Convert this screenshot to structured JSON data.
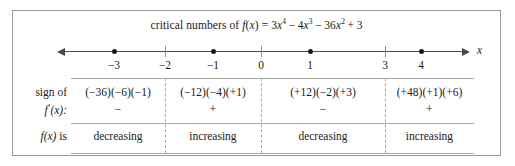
{
  "figure": {
    "title": {
      "prefix": "critical numbers of",
      "function_name": "f",
      "variable": "x",
      "equals": "=",
      "expression_plain": "3x^4 - 4x^3 - 36x^2 + 3",
      "terms": [
        {
          "coef": "3",
          "var": "x",
          "exp": "4"
        },
        {
          "op": "−",
          "coef": "4",
          "var": "x",
          "exp": "3"
        },
        {
          "op": "−",
          "coef": "36",
          "var": "x",
          "exp": "2"
        },
        {
          "op": "+",
          "coef": "3",
          "var": "",
          "exp": ""
        }
      ]
    },
    "axis": {
      "variable_label": "x",
      "left_arrow": true,
      "right_arrow": true,
      "ticks": [
        {
          "label": "−3",
          "value": -3,
          "critical": true
        },
        {
          "label": "−2",
          "value": -2,
          "critical": false
        },
        {
          "label": "−1",
          "value": -1,
          "critical": true
        },
        {
          "label": "0",
          "value": 0,
          "critical": false
        },
        {
          "label": "1",
          "value": 1,
          "critical": true
        },
        {
          "label": "3",
          "value": 3,
          "critical": false
        },
        {
          "label": "4",
          "value": 4,
          "critical": false
        }
      ],
      "critical_numbers": [
        -3,
        -1,
        1,
        4
      ]
    },
    "table": {
      "row_labels": {
        "sign_line1": "sign of",
        "sign_line2_fn": "f",
        "sign_line2_prime": "′",
        "sign_line2_arg": "(x):",
        "behavior_fn": "f",
        "behavior_arg": "(x)",
        "behavior_verb": "is"
      },
      "columns": [
        {
          "interval": "(−∞, −3)",
          "factors": "(−36)(−6)(−1)",
          "sign": "−",
          "behavior": "decreasing"
        },
        {
          "interval": "(−3, −1)",
          "factors": "(−12)(−4)(+1)",
          "sign": "+",
          "behavior": "increasing"
        },
        {
          "interval": "(−1, 4)",
          "factors": "(+12)(−2)(+3)",
          "sign": "−",
          "behavior": "decreasing"
        },
        {
          "interval": "(4, ∞)",
          "factors": "(+48)(+1)(+6)",
          "sign": "+",
          "behavior": "increasing"
        }
      ],
      "divider_positions": [
        152,
        248,
        372
      ]
    },
    "colors": {
      "border": "#9a9a9a",
      "rule": "#a8a8a8",
      "axis": "#4a4a4a",
      "text": "#1a1a1a",
      "dot": "#1a1a1a"
    }
  }
}
